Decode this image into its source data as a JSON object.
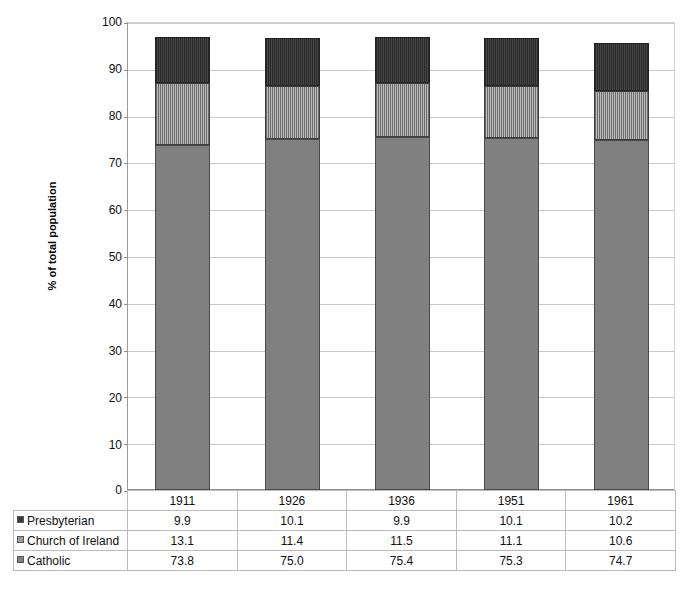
{
  "chart_data": {
    "type": "bar",
    "subtype": "stacked-column",
    "title": "",
    "xlabel": "",
    "ylabel": "% of total population",
    "ylim": [
      0,
      100
    ],
    "ytick_step": 10,
    "yticks": [
      0,
      10,
      20,
      30,
      40,
      50,
      60,
      70,
      80,
      90,
      100
    ],
    "grid": true,
    "legend_position": "data-table",
    "categories": [
      "1911",
      "1926",
      "1936",
      "1951",
      "1961"
    ],
    "series": [
      {
        "name": "Catholic",
        "values": [
          73.8,
          75.0,
          75.4,
          75.3,
          74.7
        ],
        "color": "#808080",
        "pattern": "solid"
      },
      {
        "name": "Church of Ireland",
        "values": [
          13.1,
          11.4,
          11.5,
          11.1,
          10.6
        ],
        "color": "#9d9d9d",
        "pattern": "vertical-stripes"
      },
      {
        "name": "Presbyterian",
        "values": [
          9.9,
          10.1,
          9.9,
          10.1,
          10.2
        ],
        "color": "#3b3b3b",
        "pattern": "dark-vertical-stripes"
      }
    ],
    "stack_order_bottom_to_top": [
      "Catholic",
      "Church of Ireland",
      "Presbyterian"
    ],
    "totals": [
      96.8,
      96.5,
      96.8,
      96.5,
      95.5
    ]
  },
  "axis": {
    "y_title": "% of total population",
    "y_labels": [
      "100",
      "90",
      "80",
      "70",
      "60",
      "50",
      "40",
      "30",
      "20",
      "10",
      "0"
    ]
  },
  "table": {
    "header": {
      "corner_label": "",
      "columns": [
        "1911",
        "1926",
        "1936",
        "1951",
        "1961"
      ]
    },
    "rows": [
      {
        "label": "Presbyterian",
        "swatch": "presbyterian-swatch",
        "values": [
          "9.9",
          "10.1",
          "9.9",
          "10.1",
          "10.2"
        ]
      },
      {
        "label": "Church of Ireland",
        "swatch": "church-of-ireland-swatch",
        "values": [
          "13.1",
          "11.4",
          "11.5",
          "11.1",
          "10.6"
        ]
      },
      {
        "label": "Catholic",
        "swatch": "catholic-swatch",
        "values": [
          "73.8",
          "75.0",
          "75.4",
          "75.3",
          "74.7"
        ]
      }
    ]
  },
  "caption": {
    "text": ""
  }
}
